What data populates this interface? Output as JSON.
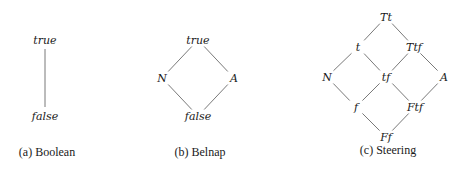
{
  "figures": [
    {
      "id": "boolean",
      "caption": "(a) Boolean",
      "nodes": [
        {
          "label": "true",
          "x": 45,
          "y": 40
        },
        {
          "label": "false",
          "x": 45,
          "y": 116
        }
      ],
      "edges": [
        [
          0,
          1
        ]
      ]
    },
    {
      "id": "belnap",
      "caption": "(b) Belnap",
      "nodes": [
        {
          "label": "true",
          "x": 198,
          "y": 40
        },
        {
          "label": "N",
          "x": 162,
          "y": 78
        },
        {
          "label": "A",
          "x": 234,
          "y": 78
        },
        {
          "label": "false",
          "x": 198,
          "y": 116
        }
      ],
      "edges": [
        [
          0,
          1
        ],
        [
          0,
          2
        ],
        [
          1,
          3
        ],
        [
          2,
          3
        ]
      ]
    },
    {
      "id": "steering",
      "caption": "(c) Steering",
      "nodes": [
        {
          "label": "Tt",
          "x": 386,
          "y": 17
        },
        {
          "label": "t",
          "x": 358,
          "y": 47
        },
        {
          "label": "Ttf",
          "x": 414,
          "y": 47
        },
        {
          "label": "N",
          "x": 327,
          "y": 77
        },
        {
          "label": "tf",
          "x": 386,
          "y": 77
        },
        {
          "label": "A",
          "x": 444,
          "y": 77
        },
        {
          "label": "f",
          "x": 356,
          "y": 107
        },
        {
          "label": "Ftf",
          "x": 415,
          "y": 107
        },
        {
          "label": "Ff",
          "x": 386,
          "y": 137
        }
      ],
      "edges": [
        [
          0,
          1
        ],
        [
          0,
          2
        ],
        [
          1,
          3
        ],
        [
          1,
          4
        ],
        [
          2,
          4
        ],
        [
          2,
          5
        ],
        [
          3,
          6
        ],
        [
          4,
          6
        ],
        [
          4,
          7
        ],
        [
          5,
          7
        ],
        [
          6,
          8
        ],
        [
          7,
          8
        ]
      ]
    }
  ],
  "captions": {
    "boolean": {
      "text": "(a) Boolean",
      "x": 47,
      "y": 148
    },
    "belnap": {
      "text": "(b) Belnap",
      "x": 200,
      "y": 148
    },
    "steering": {
      "text": "(c) Steering",
      "x": 388,
      "y": 146
    }
  },
  "colors": {
    "text": "#1a1a1a",
    "edge": "#6a6a6a",
    "background": "#ffffff"
  }
}
